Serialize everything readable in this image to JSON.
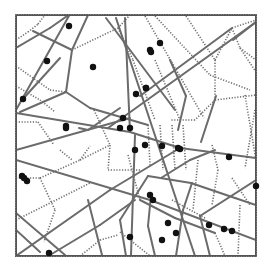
{
  "diagram": {
    "type": "voronoi-with-line-segments",
    "frame": {
      "x": 16,
      "y": 15,
      "w": 240,
      "h": 241
    },
    "colors": {
      "solid": "#6b6b6b",
      "dotted": "#6e6e6e",
      "point": "#111111",
      "background": "#ffffff"
    },
    "solid_lines": [
      [
        [
          16,
          48
        ],
        [
          50,
          28
        ]
      ],
      [
        [
          50,
          28
        ],
        [
          70,
          14
        ]
      ],
      [
        [
          33,
          31
        ],
        [
          72,
          50
        ]
      ],
      [
        [
          72,
          50
        ],
        [
          88,
          15
        ]
      ],
      [
        [
          72,
          50
        ],
        [
          66,
          92
        ]
      ],
      [
        [
          66,
          92
        ],
        [
          20,
          112
        ]
      ],
      [
        [
          66,
          92
        ],
        [
          90,
          108
        ]
      ],
      [
        [
          90,
          108
        ],
        [
          148,
          125
        ]
      ],
      [
        [
          70,
          14
        ],
        [
          16,
          110
        ]
      ],
      [
        [
          22,
          100
        ],
        [
          60,
          58
        ]
      ],
      [
        [
          16,
          113
        ],
        [
          130,
          132
        ]
      ],
      [
        [
          130,
          132
        ],
        [
          180,
          148
        ]
      ],
      [
        [
          180,
          148
        ],
        [
          256,
          158
        ]
      ],
      [
        [
          130,
          118
        ],
        [
          16,
          150
        ]
      ],
      [
        [
          16,
          160
        ],
        [
          150,
          200
        ]
      ],
      [
        [
          150,
          200
        ],
        [
          256,
          240
        ]
      ],
      [
        [
          16,
          256
        ],
        [
          110,
          190
        ]
      ],
      [
        [
          110,
          190
        ],
        [
          180,
          148
        ]
      ],
      [
        [
          16,
          213
        ],
        [
          65,
          255
        ]
      ],
      [
        [
          50,
          255
        ],
        [
          100,
          225
        ]
      ],
      [
        [
          100,
          225
        ],
        [
          135,
          200
        ]
      ],
      [
        [
          88,
          200
        ],
        [
          102,
          255
        ]
      ],
      [
        [
          125,
          18
        ],
        [
          130,
          132
        ]
      ],
      [
        [
          135,
          135
        ],
        [
          131,
          255
        ]
      ],
      [
        [
          116,
          18
        ],
        [
          195,
          256
        ]
      ],
      [
        [
          106,
          18
        ],
        [
          175,
          110
        ]
      ],
      [
        [
          108,
          128
        ],
        [
          256,
          22
        ]
      ],
      [
        [
          140,
          96
        ],
        [
          232,
          28
        ]
      ],
      [
        [
          233,
          40
        ],
        [
          256,
          22
        ]
      ],
      [
        [
          120,
          108
        ],
        [
          88,
          130
        ]
      ],
      [
        [
          88,
          130
        ],
        [
          79,
          128
        ]
      ],
      [
        [
          178,
          130
        ],
        [
          186,
          96
        ]
      ],
      [
        [
          186,
          96
        ],
        [
          170,
          60
        ]
      ],
      [
        [
          201,
          142
        ],
        [
          216,
          96
        ]
      ],
      [
        [
          148,
          176
        ],
        [
          191,
          183
        ]
      ],
      [
        [
          191,
          183
        ],
        [
          235,
          198
        ]
      ],
      [
        [
          235,
          198
        ],
        [
          256,
          205
        ]
      ],
      [
        [
          148,
          176
        ],
        [
          120,
          220
        ]
      ],
      [
        [
          120,
          220
        ],
        [
          126,
          256
        ]
      ],
      [
        [
          192,
          183
        ],
        [
          183,
          210
        ]
      ],
      [
        [
          183,
          210
        ],
        [
          176,
          256
        ]
      ],
      [
        [
          161,
          178
        ],
        [
          190,
          160
        ]
      ],
      [
        [
          190,
          160
        ],
        [
          215,
          150
        ]
      ],
      [
        [
          140,
          200
        ],
        [
          175,
          218
        ]
      ],
      [
        [
          175,
          218
        ],
        [
          215,
          233
        ]
      ],
      [
        [
          151,
          195
        ],
        [
          148,
          226
        ]
      ],
      [
        [
          148,
          226
        ],
        [
          155,
          256
        ]
      ],
      [
        [
          200,
          216
        ],
        [
          210,
          256
        ]
      ],
      [
        [
          200,
          216
        ],
        [
          256,
          180
        ]
      ],
      [
        [
          16,
          230
        ],
        [
          40,
          252
        ]
      ]
    ],
    "dotted_lines": [
      [
        [
          16,
          66
        ],
        [
          50,
          90
        ]
      ],
      [
        [
          50,
          90
        ],
        [
          66,
          92
        ]
      ],
      [
        [
          16,
          86
        ],
        [
          40,
          100
        ]
      ],
      [
        [
          40,
          100
        ],
        [
          55,
          112
        ]
      ],
      [
        [
          16,
          40
        ],
        [
          28,
          32
        ]
      ],
      [
        [
          28,
          32
        ],
        [
          38,
          24
        ]
      ],
      [
        [
          38,
          24
        ],
        [
          45,
          15
        ]
      ],
      [
        [
          72,
          50
        ],
        [
          118,
          28
        ]
      ],
      [
        [
          118,
          28
        ],
        [
          130,
          15
        ]
      ],
      [
        [
          16,
          122
        ],
        [
          38,
          122
        ]
      ],
      [
        [
          38,
          122
        ],
        [
          54,
          145
        ]
      ],
      [
        [
          16,
          178
        ],
        [
          40,
          178
        ]
      ],
      [
        [
          40,
          178
        ],
        [
          80,
          160
        ]
      ],
      [
        [
          80,
          160
        ],
        [
          90,
          146
        ]
      ],
      [
        [
          94,
          110
        ],
        [
          110,
          145
        ]
      ],
      [
        [
          110,
          145
        ],
        [
          108,
          170
        ]
      ],
      [
        [
          80,
          160
        ],
        [
          110,
          145
        ]
      ],
      [
        [
          40,
          178
        ],
        [
          55,
          210
        ]
      ],
      [
        [
          55,
          210
        ],
        [
          44,
          242
        ]
      ],
      [
        [
          16,
          220
        ],
        [
          90,
          183
        ]
      ],
      [
        [
          108,
          170
        ],
        [
          140,
          170
        ]
      ],
      [
        [
          155,
          16
        ],
        [
          210,
          75
        ]
      ],
      [
        [
          210,
          75
        ],
        [
          250,
          90
        ]
      ],
      [
        [
          145,
          16
        ],
        [
          204,
          118
        ]
      ],
      [
        [
          186,
          16
        ],
        [
          215,
          60
        ]
      ],
      [
        [
          215,
          60
        ],
        [
          232,
          28
        ]
      ],
      [
        [
          232,
          28
        ],
        [
          256,
          20
        ]
      ],
      [
        [
          232,
          28
        ],
        [
          240,
          48
        ]
      ],
      [
        [
          240,
          48
        ],
        [
          256,
          60
        ]
      ],
      [
        [
          215,
          60
        ],
        [
          215,
          100
        ]
      ],
      [
        [
          215,
          100
        ],
        [
          256,
          95
        ]
      ],
      [
        [
          215,
          100
        ],
        [
          195,
          120
        ]
      ],
      [
        [
          195,
          120
        ],
        [
          170,
          120
        ]
      ],
      [
        [
          240,
          48
        ],
        [
          256,
          72
        ]
      ],
      [
        [
          155,
          60
        ],
        [
          180,
          120
        ]
      ],
      [
        [
          118,
          28
        ],
        [
          133,
          60
        ]
      ],
      [
        [
          133,
          60
        ],
        [
          155,
          120
        ]
      ],
      [
        [
          148,
          125
        ],
        [
          150,
          165
        ]
      ],
      [
        [
          160,
          125
        ],
        [
          163,
          170
        ]
      ],
      [
        [
          172,
          125
        ],
        [
          175,
          170
        ]
      ],
      [
        [
          183,
          125
        ],
        [
          186,
          170
        ]
      ],
      [
        [
          198,
          160
        ],
        [
          193,
          210
        ]
      ],
      [
        [
          212,
          145
        ],
        [
          218,
          170
        ]
      ],
      [
        [
          218,
          170
        ],
        [
          212,
          205
        ]
      ],
      [
        [
          245,
          95
        ],
        [
          256,
          160
        ]
      ],
      [
        [
          255,
          110
        ],
        [
          245,
          168
        ]
      ],
      [
        [
          120,
          232
        ],
        [
          150,
          256
        ]
      ],
      [
        [
          80,
          256
        ],
        [
          100,
          240
        ]
      ],
      [
        [
          100,
          240
        ],
        [
          118,
          235
        ]
      ],
      [
        [
          172,
          200
        ],
        [
          205,
          218
        ]
      ],
      [
        [
          215,
          233
        ],
        [
          225,
          256
        ]
      ],
      [
        [
          240,
          205
        ],
        [
          238,
          256
        ]
      ],
      [
        [
          60,
          150
        ],
        [
          72,
          160
        ]
      ],
      [
        [
          128,
          155
        ],
        [
          140,
          200
        ]
      ],
      [
        [
          232,
          178
        ],
        [
          250,
          205
        ]
      ]
    ],
    "points": [
      [
        69,
        26
      ],
      [
        47,
        61
      ],
      [
        93,
        67
      ],
      [
        23,
        99
      ],
      [
        66,
        126
      ],
      [
        120,
        128
      ],
      [
        22,
        176
      ],
      [
        27,
        181
      ],
      [
        49,
        253
      ],
      [
        123,
        118
      ],
      [
        130,
        128
      ],
      [
        146,
        88
      ],
      [
        136,
        94
      ],
      [
        146,
        88
      ],
      [
        160,
        43
      ],
      [
        150,
        50
      ],
      [
        151,
        52
      ],
      [
        145,
        145
      ],
      [
        135,
        150
      ],
      [
        162,
        146
      ],
      [
        178,
        148
      ],
      [
        180,
        149
      ],
      [
        229,
        157
      ],
      [
        150,
        195
      ],
      [
        153,
        200
      ],
      [
        168,
        223
      ],
      [
        176,
        233
      ],
      [
        162,
        240
      ],
      [
        209,
        225
      ],
      [
        224,
        229
      ],
      [
        232,
        231
      ],
      [
        256,
        186
      ],
      [
        130,
        237
      ],
      [
        24,
        178
      ],
      [
        66,
        128
      ]
    ]
  }
}
